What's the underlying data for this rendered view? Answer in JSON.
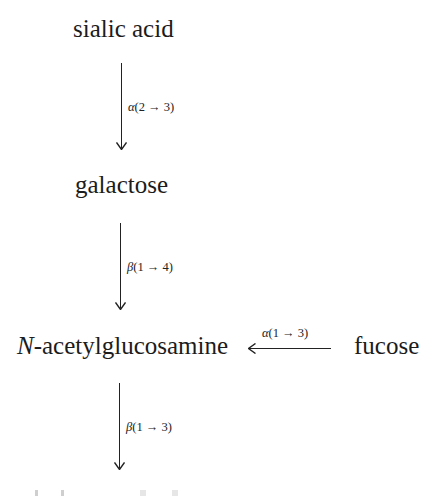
{
  "diagram": {
    "type": "glycan-linkage-chain",
    "nodes": [
      {
        "id": "sialic_acid",
        "label": "sialic acid"
      },
      {
        "id": "galactose",
        "label": "galactose"
      },
      {
        "id": "glcnac",
        "label_prefix": "N",
        "label_rest": "-acetylglucosamine"
      },
      {
        "id": "fucose",
        "label": "fucose"
      }
    ],
    "edges": [
      {
        "from": "sialic_acid",
        "to": "galactose",
        "greek": "α",
        "linkage": "(2 → 3)",
        "direction": "down"
      },
      {
        "from": "galactose",
        "to": "glcnac",
        "greek": "β",
        "linkage": "(1 → 4)",
        "direction": "down"
      },
      {
        "from": "fucose",
        "to": "glcnac",
        "greek": "α",
        "linkage": "(1 → 3)",
        "direction": "left"
      },
      {
        "from": "glcnac",
        "to": "(cropped)",
        "greek": "β",
        "linkage": "(1 → 3)",
        "direction": "down"
      }
    ]
  }
}
